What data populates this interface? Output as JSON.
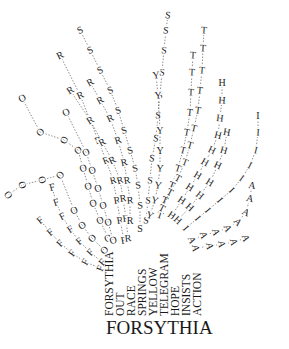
{
  "title": "FORSYTHIA",
  "stems": [
    {
      "word": "FORSYTHIA",
      "x": 104
    },
    {
      "word": "OUT",
      "x": 115
    },
    {
      "word": "RACE",
      "x": 126
    },
    {
      "word": "SPRINGS",
      "x": 137
    },
    {
      "word": "YELLOW",
      "x": 148
    },
    {
      "word": "TELEGRAM",
      "x": 159
    },
    {
      "word": "HOPE",
      "x": 170
    },
    {
      "word": "INSISTS",
      "x": 181
    },
    {
      "word": "ACTION",
      "x": 192
    }
  ],
  "strands": [
    {
      "letter": "F",
      "points": [
        [
          100,
          268
        ],
        [
          85,
          262
        ],
        [
          72,
          253
        ],
        [
          60,
          243
        ],
        [
          50,
          232
        ],
        [
          40,
          220
        ]
      ]
    },
    {
      "letter": "F",
      "points": [
        [
          102,
          262
        ],
        [
          90,
          252
        ],
        [
          79,
          241
        ],
        [
          70,
          229
        ],
        [
          62,
          216
        ],
        [
          56,
          202
        ],
        [
          52,
          187
        ]
      ]
    },
    {
      "letter": "O",
      "points": [
        [
          104,
          250
        ],
        [
          92,
          238
        ],
        [
          82,
          225
        ],
        [
          74,
          210
        ],
        [
          60,
          175
        ],
        [
          42,
          180
        ],
        [
          22,
          185
        ],
        [
          8,
          195
        ]
      ]
    },
    {
      "letter": "O",
      "points": [
        [
          108,
          238
        ],
        [
          100,
          220
        ],
        [
          93,
          203
        ],
        [
          88,
          186
        ],
        [
          83,
          168
        ],
        [
          78,
          150
        ],
        [
          64,
          140
        ],
        [
          40,
          132
        ],
        [
          22,
          98
        ]
      ]
    },
    {
      "letter": "O",
      "points": [
        [
          113,
          240
        ],
        [
          108,
          222
        ],
        [
          103,
          205
        ],
        [
          98,
          188
        ],
        [
          92,
          170
        ],
        [
          86,
          152
        ],
        [
          66,
          112
        ]
      ]
    },
    {
      "letter": "R",
      "points": [
        [
          124,
          240
        ],
        [
          120,
          220
        ],
        [
          117,
          200
        ],
        [
          113,
          180
        ],
        [
          106,
          160
        ],
        [
          98,
          140
        ],
        [
          80,
          95
        ],
        [
          60,
          55
        ]
      ]
    },
    {
      "letter": "R",
      "points": [
        [
          128,
          238
        ],
        [
          126,
          218
        ],
        [
          123,
          198
        ],
        [
          120,
          180
        ],
        [
          112,
          160
        ],
        [
          102,
          142
        ],
        [
          90,
          120
        ],
        [
          70,
          90
        ]
      ]
    },
    {
      "letter": "R",
      "points": [
        [
          130,
          220
        ],
        [
          130,
          200
        ],
        [
          127,
          180
        ],
        [
          124,
          162
        ],
        [
          118,
          140
        ],
        [
          110,
          118
        ],
        [
          100,
          100
        ],
        [
          90,
          82
        ]
      ]
    },
    {
      "letter": "S",
      "points": [
        [
          140,
          228
        ],
        [
          140,
          205
        ],
        [
          138,
          185
        ],
        [
          135,
          168
        ],
        [
          130,
          150
        ],
        [
          124,
          130
        ],
        [
          118,
          110
        ],
        [
          110,
          90
        ],
        [
          100,
          70
        ],
        [
          90,
          50
        ],
        [
          80,
          30
        ]
      ]
    },
    {
      "letter": "S",
      "points": [
        [
          146,
          220
        ],
        [
          148,
          200
        ],
        [
          150,
          180
        ],
        [
          152,
          158
        ],
        [
          156,
          138
        ],
        [
          158,
          115
        ],
        [
          160,
          95
        ],
        [
          162,
          72
        ],
        [
          164,
          50
        ],
        [
          166,
          30
        ],
        [
          168,
          15
        ]
      ]
    },
    {
      "letter": "Y",
      "points": [
        [
          150,
          215
        ],
        [
          155,
          200
        ],
        [
          158,
          185
        ],
        [
          160,
          168
        ],
        [
          160,
          150
        ],
        [
          160,
          130
        ],
        [
          158,
          95
        ],
        [
          156,
          75
        ]
      ]
    },
    {
      "letter": "T",
      "points": [
        [
          160,
          215
        ],
        [
          165,
          200
        ],
        [
          172,
          185
        ],
        [
          178,
          168
        ],
        [
          183,
          150
        ],
        [
          187,
          132
        ],
        [
          190,
          112
        ],
        [
          191,
          92
        ],
        [
          192,
          72
        ],
        [
          193,
          55
        ]
      ]
    },
    {
      "letter": "T",
      "points": [
        [
          162,
          208
        ],
        [
          170,
          192
        ],
        [
          178,
          178
        ],
        [
          185,
          162
        ],
        [
          190,
          145
        ],
        [
          194,
          128
        ],
        [
          198,
          110
        ],
        [
          200,
          90
        ],
        [
          202,
          70
        ],
        [
          203,
          48
        ],
        [
          204,
          30
        ]
      ]
    },
    {
      "letter": "H",
      "points": [
        [
          172,
          215
        ],
        [
          182,
          200
        ],
        [
          190,
          187
        ],
        [
          198,
          175
        ],
        [
          205,
          162
        ],
        [
          212,
          150
        ],
        [
          218,
          135
        ],
        [
          220,
          118
        ],
        [
          222,
          100
        ],
        [
          222,
          82
        ]
      ]
    },
    {
      "letter": "H",
      "points": [
        [
          178,
          220
        ],
        [
          190,
          207
        ],
        [
          200,
          195
        ],
        [
          210,
          182
        ],
        [
          218,
          165
        ],
        [
          224,
          150
        ],
        [
          227,
          132
        ]
      ]
    },
    {
      "letter": "I",
      "points": [
        [
          186,
          228
        ],
        [
          198,
          218
        ],
        [
          208,
          210
        ],
        [
          220,
          200
        ],
        [
          232,
          190
        ],
        [
          242,
          178
        ],
        [
          250,
          165
        ],
        [
          256,
          150
        ],
        [
          258,
          132
        ],
        [
          258,
          115
        ]
      ]
    },
    {
      "letter": "A",
      "points": [
        [
          192,
          240
        ],
        [
          204,
          235
        ],
        [
          216,
          232
        ],
        [
          228,
          228
        ],
        [
          238,
          222
        ],
        [
          246,
          212
        ],
        [
          250,
          198
        ],
        [
          252,
          185
        ]
      ]
    },
    {
      "letter": "A",
      "points": [
        [
          196,
          248
        ],
        [
          210,
          246
        ],
        [
          222,
          244
        ],
        [
          234,
          242
        ],
        [
          246,
          238
        ]
      ]
    }
  ]
}
